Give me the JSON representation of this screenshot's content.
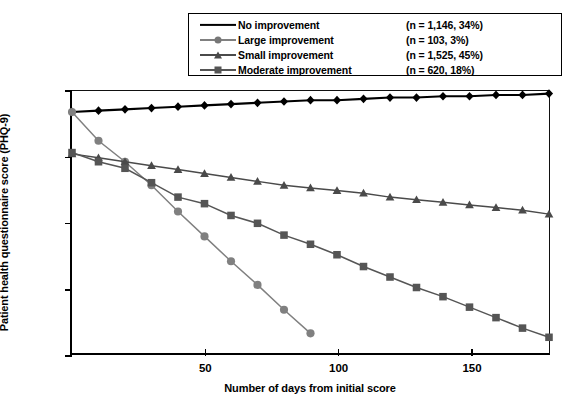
{
  "chart_data": {
    "type": "line",
    "title": "",
    "xlabel": "Number of days from initial score",
    "ylabel": "Patient health questionnaire score (PHQ-9)",
    "xlim": [
      0,
      180
    ],
    "ylim": [
      0,
      20
    ],
    "xticks": [
      50,
      100,
      150
    ],
    "yticks": [
      0,
      5,
      10,
      15,
      20
    ],
    "grid": false,
    "legend_position": "top-center",
    "series": [
      {
        "name": "No improvement",
        "n_label": "(n = 1,146, 34%)",
        "n": 1146,
        "percent": "34%",
        "color": "#000000",
        "marker": "diamond",
        "x": [
          0,
          10,
          20,
          30,
          40,
          50,
          60,
          70,
          80,
          90,
          100,
          110,
          120,
          130,
          140,
          150,
          160,
          170,
          180
        ],
        "y": [
          18.4,
          18.5,
          18.6,
          18.7,
          18.8,
          18.9,
          19.0,
          19.1,
          19.2,
          19.3,
          19.3,
          19.4,
          19.5,
          19.5,
          19.6,
          19.6,
          19.7,
          19.7,
          19.8
        ]
      },
      {
        "name": "Large improvement",
        "n_label": "(n = 103, 3%)",
        "n": 103,
        "percent": "3%",
        "color": "#808080",
        "marker": "circle",
        "x": [
          0,
          10,
          20,
          30,
          40,
          50,
          60,
          70,
          80,
          90
        ],
        "y": [
          18.4,
          16.2,
          14.6,
          12.8,
          10.8,
          8.9,
          7.0,
          5.2,
          3.3,
          1.5
        ]
      },
      {
        "name": "Small improvement",
        "n_label": "(n = 1,525, 45%)",
        "n": 1525,
        "percent": "45%",
        "color": "#4a4a4a",
        "marker": "triangle",
        "x": [
          0,
          10,
          20,
          30,
          40,
          50,
          60,
          70,
          80,
          90,
          100,
          110,
          120,
          130,
          140,
          150,
          160,
          170,
          180
        ],
        "y": [
          15.2,
          14.9,
          14.6,
          14.3,
          14.0,
          13.7,
          13.4,
          13.1,
          12.8,
          12.6,
          12.4,
          12.2,
          11.9,
          11.7,
          11.5,
          11.3,
          11.1,
          10.9,
          10.6
        ]
      },
      {
        "name": "Moderate improvement",
        "n_label": "(n = 620, 18%)",
        "n": 620,
        "percent": "18%",
        "color": "#555555",
        "marker": "square",
        "x": [
          0,
          10,
          20,
          30,
          40,
          50,
          60,
          70,
          80,
          90,
          100,
          110,
          120,
          130,
          140,
          150,
          160,
          170,
          180
        ],
        "y": [
          15.3,
          14.6,
          14.1,
          13.0,
          11.9,
          11.4,
          10.5,
          9.9,
          9.0,
          8.3,
          7.5,
          6.6,
          5.8,
          5.0,
          4.3,
          3.5,
          2.7,
          1.9,
          1.2
        ]
      }
    ]
  },
  "axes": {
    "y_title": "Patient health questionnaire score (PHQ-9)",
    "x_title": "Number of days from initial score",
    "y_tick_labels": [
      "20",
      "15",
      "10",
      "5",
      "0"
    ],
    "x_tick_labels": [
      "50",
      "100",
      "150"
    ]
  },
  "legend": {
    "rows": [
      {
        "label": "No improvement",
        "n": "(n = 1,146, 34%)"
      },
      {
        "label": "Large improvement",
        "n": "(n = 103, 3%)"
      },
      {
        "label": "Small improvement",
        "n": "(n = 1,525, 45%)"
      },
      {
        "label": "Moderate improvement",
        "n": "(n = 620, 18%)"
      }
    ]
  }
}
